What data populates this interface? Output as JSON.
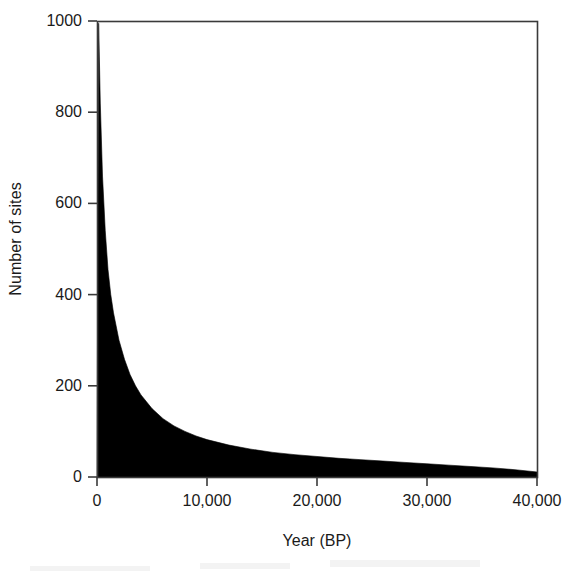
{
  "chart_data": {
    "type": "area",
    "title": "",
    "xlabel": "Year (BP)",
    "ylabel": "Number of sites",
    "xlim": [
      0,
      40000
    ],
    "ylim": [
      0,
      1000
    ],
    "grid": false,
    "legend": null,
    "xticks": [
      0,
      10000,
      20000,
      30000,
      40000
    ],
    "xtick_labels": [
      "0",
      "10,000",
      "20,000",
      "30,000",
      "40,000"
    ],
    "yticks": [
      0,
      200,
      400,
      600,
      800,
      1000
    ],
    "ytick_labels": [
      "0",
      "200",
      "400",
      "600",
      "800",
      "1000"
    ],
    "fill_color": "#000000",
    "axis_color": "#3a3a3a",
    "series": [
      {
        "name": "Number of sites",
        "x": [
          0,
          150,
          300,
          500,
          750,
          1000,
          1250,
          1500,
          2000,
          2500,
          3000,
          3500,
          4000,
          5000,
          6000,
          7000,
          8000,
          9000,
          10000,
          12000,
          14000,
          16000,
          18000,
          20000,
          22000,
          24000,
          26000,
          28000,
          30000,
          32000,
          34000,
          36000,
          38000,
          40000
        ],
        "values": [
          0,
          995,
          820,
          660,
          540,
          455,
          400,
          360,
          300,
          258,
          225,
          200,
          180,
          150,
          128,
          112,
          100,
          90,
          82,
          70,
          61,
          54,
          49,
          45,
          41,
          38,
          35,
          32,
          29,
          26,
          23,
          20,
          16,
          11
        ]
      }
    ]
  },
  "axes": {
    "plot_left_px": 97,
    "plot_right_px": 537,
    "plot_top_px": 21,
    "plot_bottom_px": 477
  }
}
